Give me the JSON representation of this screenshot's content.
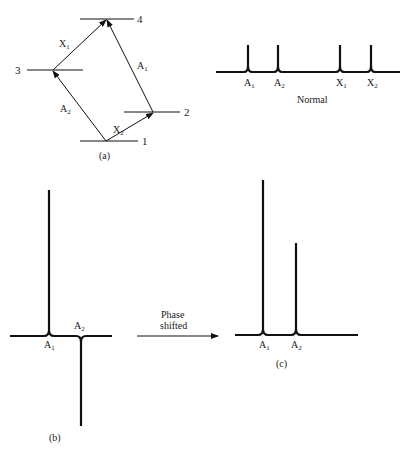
{
  "panel_a": {
    "caption": "(a)",
    "levels": [
      {
        "label": "1",
        "y": 141,
        "x1": 80,
        "x2": 138,
        "vertex_x": 106
      },
      {
        "label": "2",
        "y": 112,
        "x1": 124,
        "x2": 180,
        "vertex_x": 153
      },
      {
        "label": "3",
        "y": 70,
        "x1": 27,
        "x2": 83,
        "vertex_x": 53
      },
      {
        "label": "4",
        "y": 19,
        "x1": 80,
        "x2": 134,
        "vertex_x": 106
      }
    ],
    "transitions": [
      {
        "label": "A",
        "sub": "2",
        "from": "1",
        "to": "3"
      },
      {
        "label": "X",
        "sub": "2",
        "from": "1",
        "to": "2"
      },
      {
        "label": "X",
        "sub": "1",
        "from": "3",
        "to": "4"
      },
      {
        "label": "A",
        "sub": "1",
        "from": "2",
        "to": "4"
      }
    ]
  },
  "normal": {
    "caption": "Normal",
    "peaks": [
      {
        "label": "A",
        "sub": "1"
      },
      {
        "label": "A",
        "sub": "2"
      },
      {
        "label": "X",
        "sub": "1"
      },
      {
        "label": "X",
        "sub": "2"
      }
    ]
  },
  "panel_b": {
    "caption": "(b)",
    "peaks": [
      {
        "label": "A",
        "sub": "1",
        "direction": "up"
      },
      {
        "label": "A",
        "sub": "2",
        "direction": "down"
      }
    ]
  },
  "arrow": {
    "line1": "Phase",
    "line2": "shifted"
  },
  "panel_c": {
    "caption": "(c)",
    "peaks": [
      {
        "label": "A",
        "sub": "1",
        "relative_height": "tall"
      },
      {
        "label": "A",
        "sub": "2",
        "relative_height": "medium"
      }
    ]
  }
}
